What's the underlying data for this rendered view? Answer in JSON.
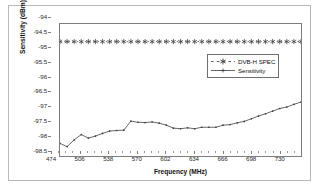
{
  "chart_data": {
    "type": "line",
    "title": "",
    "xlabel": "Frequency (MHz)",
    "ylabel": "Sensitivity (dBm)",
    "xlim": [
      474,
      746
    ],
    "ylim": [
      -98.5,
      -94
    ],
    "xticks": [
      474,
      506,
      538,
      570,
      602,
      634,
      666,
      698,
      730
    ],
    "yticks": [
      -94,
      -94.5,
      -95,
      -95.5,
      -96,
      -96.5,
      -97,
      -97.5,
      -98,
      -98.5
    ],
    "grid": false,
    "legend_position": "upper-right",
    "series": [
      {
        "name": "DVB-H SPEC",
        "style": "dashed",
        "marker": "asterisk",
        "color": "#4d4d4d",
        "x": [
          474,
          482,
          490,
          498,
          506,
          514,
          522,
          530,
          538,
          546,
          554,
          562,
          570,
          578,
          586,
          594,
          602,
          610,
          618,
          626,
          634,
          642,
          650,
          658,
          666,
          674,
          682,
          690,
          698,
          706,
          714,
          722,
          730,
          738,
          746
        ],
        "values": [
          -94.6,
          -94.6,
          -94.6,
          -94.6,
          -94.6,
          -94.6,
          -94.6,
          -94.6,
          -94.6,
          -94.6,
          -94.6,
          -94.6,
          -94.6,
          -94.6,
          -94.6,
          -94.6,
          -94.6,
          -94.6,
          -94.6,
          -94.6,
          -94.6,
          -94.6,
          -94.6,
          -94.6,
          -94.6,
          -94.6,
          -94.6,
          -94.6,
          -94.6,
          -94.6,
          -94.6,
          -94.6,
          -94.6,
          -94.6,
          -94.6
        ]
      },
      {
        "name": "Sensitivity",
        "style": "solid",
        "marker": "dot",
        "color": "#555555",
        "x": [
          474,
          482,
          490,
          498,
          506,
          514,
          522,
          530,
          538,
          546,
          554,
          562,
          570,
          578,
          586,
          594,
          602,
          610,
          618,
          626,
          634,
          642,
          650,
          658,
          666,
          674,
          682,
          690,
          698,
          706,
          714,
          722,
          730,
          738,
          746
        ],
        "values": [
          -98.07,
          -98.18,
          -97.95,
          -97.77,
          -97.89,
          -97.82,
          -97.73,
          -97.65,
          -97.63,
          -97.62,
          -97.31,
          -97.35,
          -97.36,
          -97.34,
          -97.38,
          -97.45,
          -97.55,
          -97.57,
          -97.54,
          -97.57,
          -97.52,
          -97.52,
          -97.52,
          -97.45,
          -97.43,
          -97.37,
          -97.32,
          -97.23,
          -97.14,
          -97.06,
          -96.97,
          -96.88,
          -96.83,
          -96.74,
          -96.66
        ]
      }
    ]
  }
}
